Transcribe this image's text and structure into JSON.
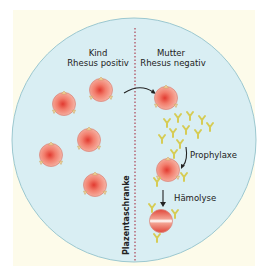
{
  "diagram": {
    "left_title_line1": "Kind",
    "left_title_line2": "Rhesus positiv",
    "right_title_line1": "Mutter",
    "right_title_line2": "Rhesus negativ",
    "barrier_label": "Plazentaschranke",
    "step1_label": "Prophylaxe",
    "step2_label": "Hämolyse"
  },
  "colors": {
    "background": "#ffffff",
    "panel": "#fdfbea",
    "circle_fill": "#d9eef3",
    "circle_stroke": "#8fbfc9",
    "barrier_line": "#b05060",
    "cell": "#f08a78",
    "cell_center": "#e8473a",
    "antigen": "#f3d49a",
    "antibody": "#d8d060"
  }
}
